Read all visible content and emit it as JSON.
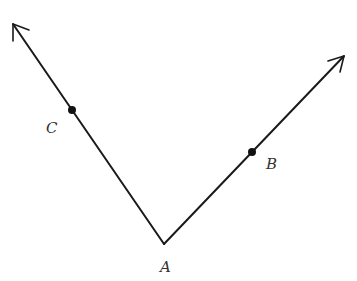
{
  "diagram": {
    "type": "angle",
    "vertex": {
      "name": "A",
      "label": "A",
      "x": 164,
      "y": 244,
      "label_x": 160,
      "label_y": 272
    },
    "rays": [
      {
        "name": "ray-AC",
        "from": "A",
        "through": "C",
        "end": {
          "x": 13,
          "y": 24
        }
      },
      {
        "name": "ray-AB",
        "from": "A",
        "through": "B",
        "end": {
          "x": 344,
          "y": 56
        }
      }
    ],
    "points": [
      {
        "name": "C",
        "label": "C",
        "x": 72,
        "y": 110,
        "label_x": 46,
        "label_y": 133
      },
      {
        "name": "B",
        "label": "B",
        "x": 252,
        "y": 152,
        "label_x": 266,
        "label_y": 169
      }
    ],
    "colors": {
      "line": "#1a1a1a",
      "point": "#111111",
      "label": "#333333",
      "background": "#ffffff"
    }
  }
}
